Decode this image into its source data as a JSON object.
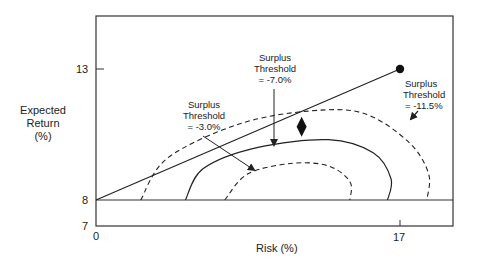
{
  "chart_data": {
    "type": "line",
    "title": "",
    "xlabel": "Risk (%)",
    "ylabel": [
      "Expected",
      "Return",
      "(%)"
    ],
    "x_ticks": [
      "0",
      "17"
    ],
    "y_ticks": [
      "13",
      "8",
      "7"
    ],
    "xlim": [
      0,
      20
    ],
    "ylim": [
      7,
      15
    ],
    "grid": false,
    "series": [
      {
        "name": "Asset allocation line",
        "style": "solid",
        "points": [
          [
            0,
            8
          ],
          [
            17,
            13
          ]
        ],
        "endpoint_marker": "circle"
      },
      {
        "name": "Surplus Threshold = -11.5%",
        "style": "dashed",
        "points": [
          [
            2.5,
            8
          ],
          [
            4,
            9.6
          ],
          [
            8,
            10.9
          ],
          [
            12,
            11.4
          ],
          [
            15,
            11.3
          ],
          [
            17.5,
            10.2
          ],
          [
            18.6,
            9
          ],
          [
            18.5,
            8
          ]
        ]
      },
      {
        "name": "Surplus Threshold = -7.0%",
        "style": "solid",
        "points": [
          [
            5,
            8
          ],
          [
            6,
            9.2
          ],
          [
            9,
            10.0
          ],
          [
            13,
            10.3
          ],
          [
            15.5,
            9.8
          ],
          [
            16.5,
            8.8
          ],
          [
            16.3,
            8
          ]
        ]
      },
      {
        "name": "Surplus Threshold = -3.0%",
        "style": "dashed",
        "points": [
          [
            7.2,
            8
          ],
          [
            8.5,
            9.0
          ],
          [
            11,
            9.4
          ],
          [
            13,
            9.3
          ],
          [
            14.2,
            8.7
          ],
          [
            14.2,
            8
          ]
        ]
      }
    ],
    "markers": [
      {
        "name": "optimal-point",
        "shape": "diamond",
        "x": 11.5,
        "y": 10.8
      },
      {
        "name": "max-return-point",
        "shape": "circle",
        "x": 17,
        "y": 13
      }
    ],
    "annotations": [
      {
        "lines": [
          "Surplus",
          "Threshold",
          "= -3.0%"
        ],
        "target": "Surplus Threshold = -3.0%"
      },
      {
        "lines": [
          "Surplus",
          "Threshold",
          "= -7.0%"
        ],
        "target": "Surplus Threshold = -7.0%"
      },
      {
        "lines": [
          "Surplus",
          "Threshold",
          "= -11.5%"
        ],
        "target": "Surplus Threshold = -11.5%"
      }
    ],
    "colors": {
      "ink": "#222222",
      "background": "#ffffff"
    }
  }
}
